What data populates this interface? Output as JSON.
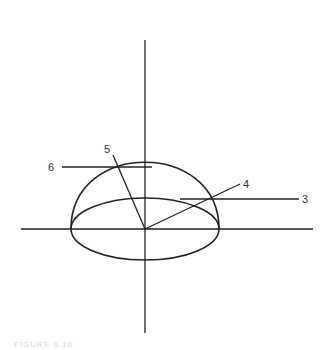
{
  "diagram": {
    "labels": [
      {
        "id": "3",
        "text": "3"
      },
      {
        "id": "4",
        "text": "4"
      },
      {
        "id": "5",
        "text": "5"
      },
      {
        "id": "6",
        "text": "6"
      }
    ],
    "caption": "FIGURE 8.10",
    "colors": {
      "stroke": "#222222",
      "background": "#ffffff"
    }
  }
}
